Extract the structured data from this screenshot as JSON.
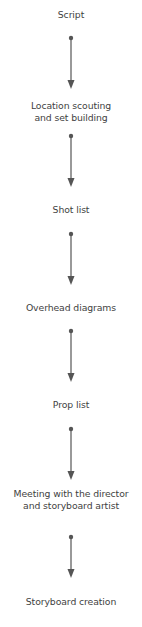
{
  "diagram": {
    "type": "vertical-flowchart",
    "arrow_color": "#555555",
    "text_color": "#3f3f3f",
    "steps": [
      {
        "lines": [
          "Script"
        ]
      },
      {
        "lines": [
          "Location scouting",
          "and set building"
        ]
      },
      {
        "lines": [
          "Shot list"
        ]
      },
      {
        "lines": [
          "Overhead diagrams"
        ]
      },
      {
        "lines": [
          "Prop list"
        ]
      },
      {
        "lines": [
          "Meeting with the director",
          "and storyboard artist"
        ]
      },
      {
        "lines": [
          "Storyboard creation"
        ]
      }
    ]
  }
}
